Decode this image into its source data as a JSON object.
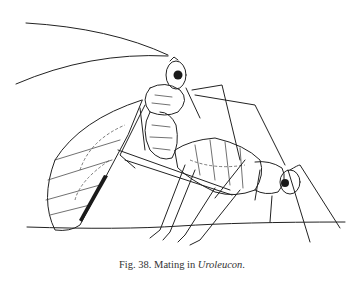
{
  "figure": {
    "label": "Fig. 38.",
    "caption_prefix": "Mating in ",
    "caption_taxon": "Uroleucon",
    "caption_suffix": ".",
    "illustration": "line drawing of two aphids mating on a stem: winged male above, wingless female below"
  }
}
